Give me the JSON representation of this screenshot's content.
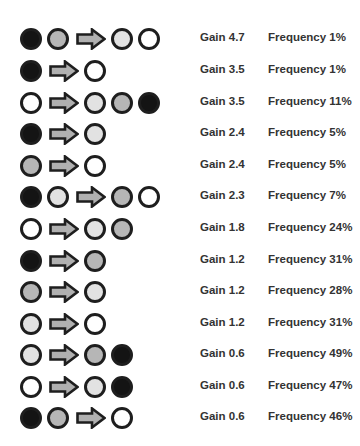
{
  "colors": {
    "black": "#141414",
    "mid": "#b6b6b6",
    "light": "#e2e2e2",
    "white": "#ffffff",
    "outline": "#1e1e1e",
    "arrow_fill": "#b0b0b0"
  },
  "rows": [
    {
      "from": [
        "black",
        "mid"
      ],
      "to": [
        "light",
        "white"
      ],
      "gain": "Gain 4.7",
      "frequency": "Frequency 1%"
    },
    {
      "from": [
        "black"
      ],
      "to": [
        "white"
      ],
      "gain": "Gain 3.5",
      "frequency": "Frequency 1%"
    },
    {
      "from": [
        "white"
      ],
      "to": [
        "light",
        "mid",
        "black"
      ],
      "gain": "Gain 3.5",
      "frequency": "Frequency 11%"
    },
    {
      "from": [
        "black"
      ],
      "to": [
        "light"
      ],
      "gain": "Gain 2.4",
      "frequency": "Frequency 5%"
    },
    {
      "from": [
        "mid"
      ],
      "to": [
        "white"
      ],
      "gain": "Gain 2.4",
      "frequency": "Frequency 5%"
    },
    {
      "from": [
        "black",
        "light"
      ],
      "to": [
        "mid",
        "white"
      ],
      "gain": "Gain 2.3",
      "frequency": "Frequency 7%"
    },
    {
      "from": [
        "white"
      ],
      "to": [
        "light",
        "mid"
      ],
      "gain": "Gain 1.8",
      "frequency": "Frequency 24%"
    },
    {
      "from": [
        "black"
      ],
      "to": [
        "mid"
      ],
      "gain": "Gain 1.2",
      "frequency": "Frequency 31%"
    },
    {
      "from": [
        "mid"
      ],
      "to": [
        "light"
      ],
      "gain": "Gain 1.2",
      "frequency": "Frequency 28%"
    },
    {
      "from": [
        "light"
      ],
      "to": [
        "white"
      ],
      "gain": "Gain 1.2",
      "frequency": "Frequency 31%"
    },
    {
      "from": [
        "light"
      ],
      "to": [
        "mid",
        "black"
      ],
      "gain": "Gain 0.6",
      "frequency": "Frequency 49%"
    },
    {
      "from": [
        "white"
      ],
      "to": [
        "light",
        "black"
      ],
      "gain": "Gain 0.6",
      "frequency": "Frequency 47%"
    },
    {
      "from": [
        "black",
        "mid"
      ],
      "to": [
        "white"
      ],
      "gain": "Gain 0.6",
      "frequency": "Frequency 46%"
    }
  ]
}
